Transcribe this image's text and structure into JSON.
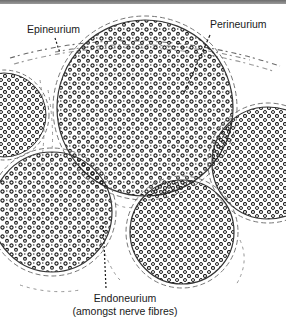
{
  "diagram": {
    "labels": {
      "epineurium": "Epineurium",
      "perineurium": "Perineurium",
      "endoneurium_line1": "Endoneurium",
      "endoneurium_line2": "(amongst nerve fibres)"
    },
    "fascicles": [
      {
        "name": "central-large",
        "cx": 145,
        "cy": 108,
        "r": 88
      },
      {
        "name": "left-top-partial",
        "cx": 4,
        "cy": 115,
        "r": 42
      },
      {
        "name": "right-partial",
        "cx": 268,
        "cy": 163,
        "r": 56
      },
      {
        "name": "bottom-left",
        "cx": 52,
        "cy": 212,
        "r": 60
      },
      {
        "name": "bottom-center",
        "cx": 182,
        "cy": 232,
        "r": 52
      }
    ],
    "colors": {
      "ink": "#1a1a1a",
      "sheath": "#555555",
      "background": "#ffffff",
      "topbar": "#7a7a7a"
    }
  }
}
